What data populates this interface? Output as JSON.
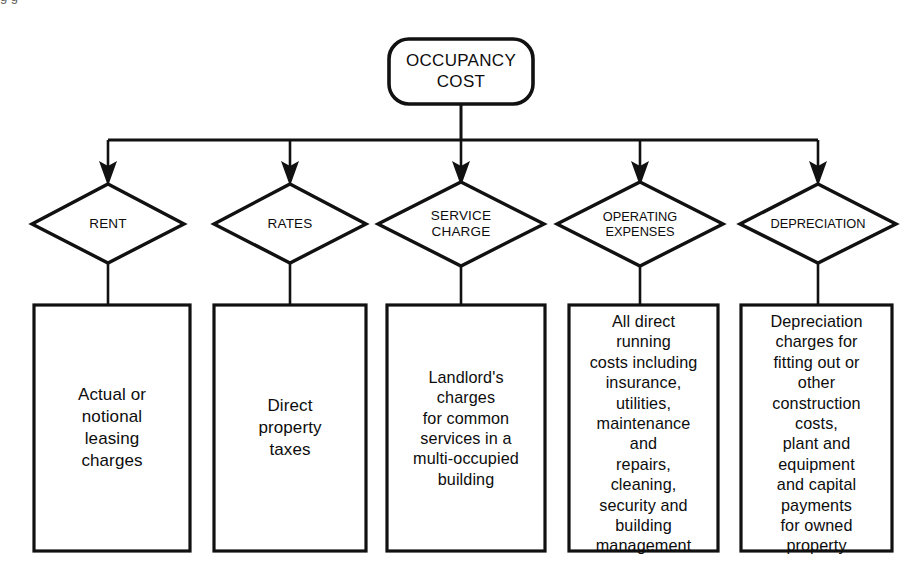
{
  "diagram": {
    "type": "hierarchy-flowchart",
    "canvas": {
      "width": 914,
      "height": 571
    },
    "colors": {
      "line": "#111111",
      "background": "#ffffff",
      "text": "#0d0d0d"
    },
    "root": {
      "id": "occupancy-cost",
      "shape": "rounded-rectangle",
      "label": "OCCUPANCY\nCOST"
    },
    "branches": [
      {
        "id": "rent",
        "shape": "diamond",
        "label": "RENT",
        "detail": "Actual or\nnotional\nleasing\ncharges"
      },
      {
        "id": "rates",
        "shape": "diamond",
        "label": "RATES",
        "detail": "Direct\nproperty\ntaxes"
      },
      {
        "id": "service-charge",
        "shape": "diamond",
        "label": "SERVICE\nCHARGE",
        "detail": "Landlord's\ncharges\nfor common\nservices in a\nmulti-occupied\nbuilding"
      },
      {
        "id": "operating-expenses",
        "shape": "diamond",
        "label": "OPERATING\nEXPENSES",
        "detail": "All direct\nrunning\ncosts including\ninsurance,\nutilities,\nmaintenance\nand\nrepairs,\ncleaning,\nsecurity and\nbuilding\nmanagement"
      },
      {
        "id": "depreciation",
        "shape": "diamond",
        "label": "DEPRECIATION",
        "detail": "Depreciation\ncharges for\nfitting out or\nother\nconstruction\ncosts,\nplant and\nequipment\nand capital\npayments\nfor owned\nproperty"
      }
    ],
    "scan_artifact": "g g"
  }
}
